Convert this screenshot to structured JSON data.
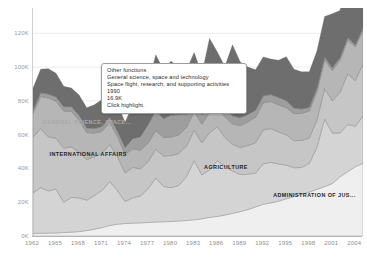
{
  "chart_data": {
    "type": "area",
    "title": "",
    "subtitle": "",
    "xlabel": "",
    "ylabel": "",
    "stacked": true,
    "grid": true,
    "legend_position": "in-plot-labels",
    "xlim": [
      1962,
      2005
    ],
    "ylim": [
      0,
      135000
    ],
    "y_ticks": [
      "0K",
      "20K",
      "40K",
      "60K",
      "80K",
      "100K",
      "120K"
    ],
    "y_tick_values": [
      0,
      20000,
      40000,
      60000,
      80000,
      100000,
      120000
    ],
    "x_ticks": [
      "1962",
      "1965",
      "1968",
      "1971",
      "1974",
      "1977",
      "1980",
      "1983",
      "1986",
      "1989",
      "1992",
      "1995",
      "1998",
      "2001",
      "2004"
    ],
    "x_tick_values": [
      1962,
      1965,
      1968,
      1971,
      1974,
      1977,
      1980,
      1983,
      1986,
      1989,
      1992,
      1995,
      1998,
      2001,
      2004
    ],
    "x": [
      1962,
      1963,
      1964,
      1965,
      1966,
      1967,
      1968,
      1969,
      1970,
      1971,
      1972,
      1973,
      1974,
      1975,
      1976,
      1977,
      1978,
      1979,
      1980,
      1981,
      1982,
      1983,
      1984,
      1985,
      1986,
      1987,
      1988,
      1989,
      1990,
      1991,
      1992,
      1993,
      1994,
      1995,
      1996,
      1997,
      1998,
      1999,
      2000,
      2001,
      2002,
      2003,
      2004,
      2005
    ],
    "series": [
      {
        "name": "ADMINISTRATION OF JUSTICE",
        "color": "#efefef",
        "values": [
          1500,
          1600,
          1700,
          1800,
          2000,
          2300,
          2600,
          3200,
          4000,
          5000,
          6200,
          7000,
          7400,
          7600,
          7800,
          8000,
          8300,
          8400,
          8600,
          8900,
          9200,
          9600,
          10200,
          11000,
          11600,
          12400,
          13400,
          14400,
          15600,
          17200,
          18800,
          19600,
          20600,
          22000,
          23400,
          24600,
          26000,
          27600,
          29200,
          31000,
          35000,
          38000,
          41000,
          43000
        ]
      },
      {
        "name": "AGRICULTURE",
        "color": "#d4d4d4",
        "values": [
          24000,
          27000,
          25000,
          26000,
          18000,
          20500,
          20000,
          18000,
          20000,
          22000,
          26000,
          20000,
          13000,
          15000,
          16000,
          20000,
          26000,
          21000,
          20000,
          21000,
          26000,
          35000,
          26000,
          28000,
          33000,
          29000,
          25000,
          22000,
          21000,
          20000,
          24000,
          24000,
          22000,
          20000,
          17000,
          16000,
          17000,
          25000,
          40000,
          30000,
          26000,
          28000,
          24000,
          28000
        ]
      },
      {
        "name": "INTERNATIONAL AFFAIRS",
        "color": "#c6c6c6",
        "values": [
          33000,
          35000,
          32000,
          30000,
          32000,
          30000,
          27000,
          24000,
          23000,
          22000,
          22000,
          20000,
          17000,
          18000,
          16000,
          16000,
          17000,
          18000,
          19000,
          19000,
          18000,
          18000,
          19000,
          22000,
          20000,
          17000,
          16000,
          16000,
          17000,
          18000,
          20000,
          20000,
          19000,
          18000,
          16000,
          16000,
          15000,
          16000,
          18000,
          19000,
          24000,
          30000,
          27000,
          31000
        ]
      },
      {
        "name": "GENERAL SCIENCE, SPACE AND TECHNOLOGY",
        "color": "#b6b6b6",
        "values": [
          14000,
          19000,
          23000,
          22000,
          22000,
          21000,
          19000,
          16000,
          14000,
          13000,
          13000,
          12000,
          11000,
          11000,
          11000,
          11000,
          11000,
          11000,
          11000,
          11000,
          11000,
          11000,
          11000,
          12000,
          12000,
          12000,
          12000,
          13000,
          14000,
          15000,
          16000,
          16000,
          16000,
          16000,
          16000,
          16000,
          16000,
          17000,
          17000,
          18000,
          19000,
          20000,
          20000,
          20000
        ]
      },
      {
        "name": "ENERGY",
        "color": "#9e9e9e",
        "values": [
          2000,
          2200,
          2400,
          2500,
          2600,
          2800,
          2900,
          2800,
          2700,
          2800,
          3000,
          3200,
          4000,
          6000,
          8000,
          11000,
          12000,
          11000,
          13000,
          12000,
          8000,
          6000,
          5500,
          6000,
          5500,
          5000,
          4800,
          4600,
          4400,
          4300,
          4200,
          4200,
          4400,
          4200,
          3400,
          2600,
          2200,
          2000,
          1800,
          1600,
          1500,
          1400,
          1300,
          1400
        ]
      },
      {
        "name": "OTHER FUNCTIONS",
        "color": "#6e6e6e",
        "values": [
          13000,
          14000,
          15000,
          14000,
          12000,
          11000,
          12000,
          12000,
          14000,
          16000,
          18000,
          16000,
          15000,
          20000,
          22000,
          24000,
          33000,
          29000,
          32000,
          27000,
          26000,
          29000,
          24000,
          38000,
          27000,
          25000,
          42000,
          33000,
          28000,
          24000,
          23000,
          21000,
          22000,
          26000,
          23000,
          22000,
          21000,
          22000,
          24000,
          32000,
          28000,
          34000,
          30000,
          36000
        ]
      }
    ],
    "in_plot_labels": [
      {
        "text": "GENERA...",
        "x_pct": 22.0,
        "y_pct": 36.0,
        "color": "#2f2f2f"
      },
      {
        "text": "GENERAL SCIENCE, SPACE...",
        "x_pct": 3.0,
        "y_pct": 48.5,
        "color": "#a9a9a9"
      },
      {
        "text": "INTERNATIONAL AFFAIRS",
        "x_pct": 5.0,
        "y_pct": 62.5,
        "color": "#1f1f1f"
      },
      {
        "text": "AGRICULTURE",
        "x_pct": 52.0,
        "y_pct": 68.5,
        "color": "#1f1f1f"
      },
      {
        "text": "ADMINISTRATION OF JUS...",
        "x_pct": 73.0,
        "y_pct": 80.5,
        "color": "#1f1f1f"
      }
    ]
  },
  "tooltip": {
    "lines": [
      "Other functions",
      "General science, space and technology",
      "Space flight, research, and supporting activities",
      "1990",
      "16.9K",
      "Click highlight."
    ],
    "series_name": "Other functions",
    "category": "General science, space and technology",
    "subcategory": "Space flight, research, and supporting activities",
    "year": "1990",
    "value": "16.9K",
    "hint": "Click highlight."
  },
  "colors": {
    "background": "#ffffff",
    "axis": "#b5b5b5",
    "gridline": "#ededed",
    "tick_text": "#9a9a9a",
    "tooltip_border": "#9d9d9d",
    "tooltip_bg": "#ffffff"
  }
}
